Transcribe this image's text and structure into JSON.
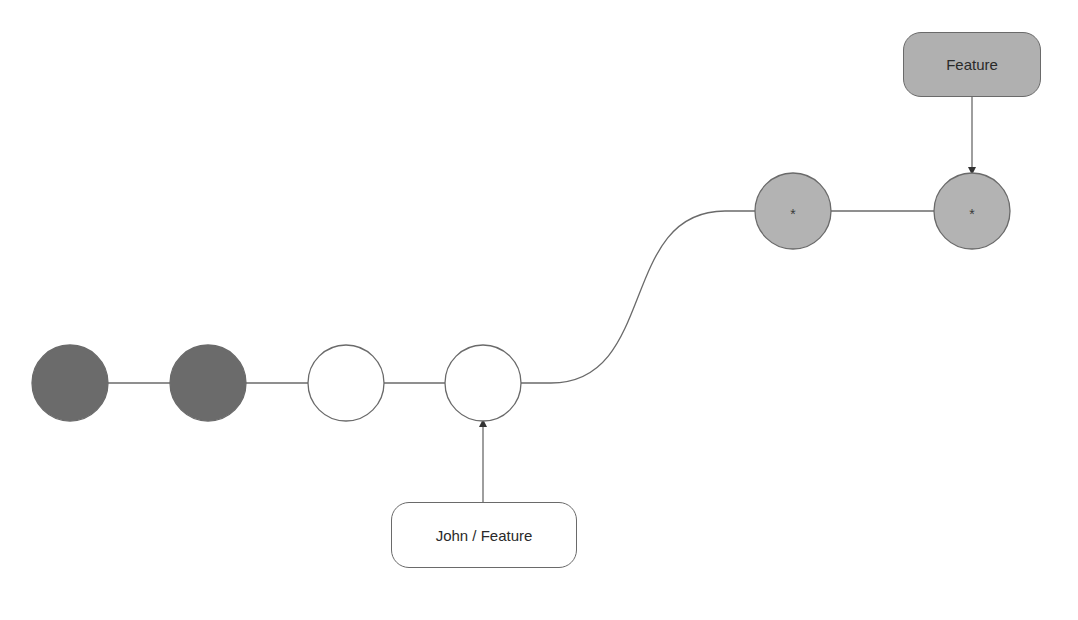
{
  "diagram": {
    "type": "git-branch-graph",
    "colors": {
      "background": "#ffffff",
      "line": "#6a6a6a",
      "commit_dark": "#6b6b6b",
      "commit_light": "#b3b3b3",
      "commit_empty": "#ffffff",
      "label_fill_gray": "#b0b0b0",
      "label_fill_white": "#ffffff"
    },
    "commits": [
      {
        "id": "c1",
        "cx": 70,
        "cy": 383,
        "r": 38,
        "style": "dark",
        "mark": ""
      },
      {
        "id": "c2",
        "cx": 208,
        "cy": 383,
        "r": 38,
        "style": "dark",
        "mark": ""
      },
      {
        "id": "c3",
        "cx": 346,
        "cy": 383,
        "r": 38,
        "style": "empty",
        "mark": ""
      },
      {
        "id": "c4",
        "cx": 483,
        "cy": 383,
        "r": 38,
        "style": "empty",
        "mark": ""
      },
      {
        "id": "c5",
        "cx": 793,
        "cy": 211,
        "r": 38,
        "style": "light",
        "mark": "*"
      },
      {
        "id": "c6",
        "cx": 972,
        "cy": 211,
        "r": 38,
        "style": "light",
        "mark": "*"
      }
    ],
    "edges": [
      {
        "from": "c1",
        "to": "c2",
        "kind": "straight"
      },
      {
        "from": "c2",
        "to": "c3",
        "kind": "straight"
      },
      {
        "from": "c3",
        "to": "c4",
        "kind": "straight"
      },
      {
        "from": "c4",
        "to": "c5",
        "kind": "curve"
      },
      {
        "from": "c5",
        "to": "c6",
        "kind": "straight"
      }
    ],
    "labels": [
      {
        "id": "feature",
        "text": "Feature",
        "x": 903,
        "y": 32,
        "w": 138,
        "h": 65,
        "fill": "gray",
        "points_to": "c6"
      },
      {
        "id": "john-feature",
        "text": "John / Feature",
        "x": 391,
        "y": 502,
        "w": 186,
        "h": 66,
        "fill": "white",
        "points_to": "c4"
      }
    ]
  }
}
